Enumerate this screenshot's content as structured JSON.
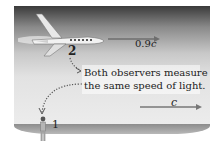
{
  "figure": {
    "observer_2_label": "2",
    "observer_1_label": "1",
    "plane_speed_label": "0.9",
    "plane_speed_unit": "c",
    "light_speed_label": "c",
    "caption_line1": "Both observers measure",
    "caption_line2": "the same speed of light.",
    "colors": {
      "sky_top": "#3a3a3a",
      "sky_bottom": "#ececec",
      "ground": "#9a9a9a",
      "arrow": "#6e6e6e",
      "text": "#222222"
    }
  }
}
